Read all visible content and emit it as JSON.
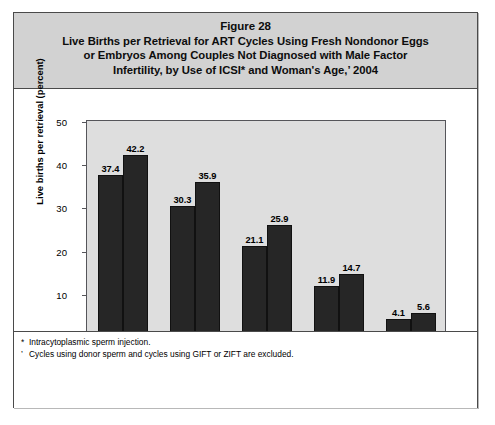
{
  "figure": {
    "number": "Figure 28",
    "title_lines": [
      "Live Births per Retrieval for ART Cycles Using Fresh Nondonor Eggs",
      "or Embryos Among Couples Not Diagnosed with Male Factor",
      "Infertility, by Use of ICSI* and Woman's Age,’ 2004"
    ]
  },
  "chart_data": {
    "type": "bar",
    "title": "Live Births per Retrieval for ART Cycles Using Fresh Nondonor Eggs or Embryos Among Couples Not Diagnosed with Male Factor Infertility, by Use of ICSI* and Woman's Age,’ 2004",
    "xlabel": "Age (years)",
    "ylabel": "Live births per retrieval (percent)",
    "categories": [
      "<35",
      "35–37",
      "38–40",
      "41–42",
      ">42"
    ],
    "series": [
      {
        "name": "IVF with ICSI among couples with no male factor infertility",
        "color": "#262626",
        "values": [
          37.4,
          30.3,
          21.1,
          11.9,
          4.1
        ]
      },
      {
        "name": "IVF without ICSI among couples with no male factor infertility",
        "color": "#262626",
        "values": [
          42.2,
          35.9,
          25.9,
          14.7,
          5.6
        ]
      }
    ],
    "ylim": [
      0,
      50
    ],
    "yticks": [
      0,
      10,
      20,
      30,
      40,
      50
    ],
    "ytick_labels": [
      "0",
      "10",
      "20",
      "30",
      "40",
      "50"
    ],
    "grid": false,
    "legend_position": "bottom",
    "plot_background": "#dedede"
  },
  "legend": [
    {
      "line1": "IVF with ICSI among couples",
      "line2": "with no male factor infertility"
    },
    {
      "line1": "IVF without ICSI among couples",
      "line2": "with no male factor infertility"
    }
  ],
  "footnotes": [
    {
      "mark": "*",
      "text": "Intracytoplasmic sperm injection."
    },
    {
      "mark": "’",
      "text": "Cycles using donor sperm and cycles using GIFT or ZIFT are excluded."
    }
  ]
}
